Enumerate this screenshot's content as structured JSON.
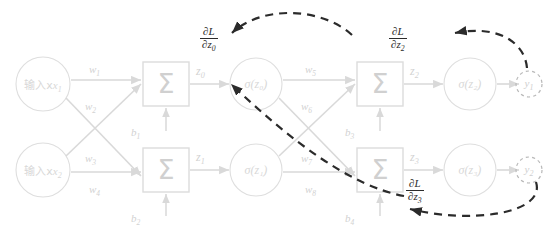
{
  "diagram": {
    "colors": {
      "forward": "#d9d9d9",
      "forward_text": "#d2d2d2",
      "gradient": "#2b2b2b",
      "background": "#ffffff"
    },
    "inputs": [
      {
        "id": "x1",
        "label": "输入x",
        "sub": "1"
      },
      {
        "id": "x2",
        "label": "输入x",
        "sub": "2"
      }
    ],
    "sum_symbol": "Σ",
    "hidden_sums": [
      {
        "id": "sum1",
        "symbol": "Σ"
      },
      {
        "id": "sum2",
        "symbol": "Σ"
      }
    ],
    "output_sums": [
      {
        "id": "sum3",
        "symbol": "Σ"
      },
      {
        "id": "sum4",
        "symbol": "Σ"
      }
    ],
    "weights_input": [
      {
        "id": "w1",
        "label": "w",
        "sub": "1"
      },
      {
        "id": "w2",
        "label": "w",
        "sub": "2"
      },
      {
        "id": "w3",
        "label": "w",
        "sub": "3"
      },
      {
        "id": "w4",
        "label": "w",
        "sub": "4"
      }
    ],
    "weights_hidden": [
      {
        "id": "w5",
        "label": "w",
        "sub": "5"
      },
      {
        "id": "w6",
        "label": "w",
        "sub": "6"
      },
      {
        "id": "w7",
        "label": "w",
        "sub": "7"
      },
      {
        "id": "w8",
        "label": "w",
        "sub": "8"
      }
    ],
    "biases": [
      {
        "id": "b1",
        "label": "b",
        "sub": "1"
      },
      {
        "id": "b2",
        "label": "b",
        "sub": "2"
      },
      {
        "id": "b3",
        "label": "b",
        "sub": "3"
      },
      {
        "id": "b4",
        "label": "b",
        "sub": "4"
      }
    ],
    "pre_activations": [
      {
        "id": "z0",
        "label": "z",
        "sub": "0"
      },
      {
        "id": "z1",
        "label": "z",
        "sub": "1"
      },
      {
        "id": "z2",
        "label": "z",
        "sub": "2"
      },
      {
        "id": "z3",
        "label": "z",
        "sub": "3"
      }
    ],
    "activations": [
      {
        "id": "sz0",
        "label": "σ(z₀)"
      },
      {
        "id": "sz1",
        "label": "σ(z₁)"
      },
      {
        "id": "sz2",
        "label": "σ(z₂)"
      },
      {
        "id": "sz3",
        "label": "σ(z₃)"
      }
    ],
    "outputs": [
      {
        "id": "y1",
        "label": "y",
        "sub": "1"
      },
      {
        "id": "y2",
        "label": "y",
        "sub": "2"
      }
    ],
    "gradients": [
      {
        "id": "dLdz0",
        "numerator": "∂L",
        "denominator": "∂z",
        "den_sub": "0"
      },
      {
        "id": "dLdz2",
        "numerator": "∂L",
        "denominator": "∂z",
        "den_sub": "2"
      },
      {
        "id": "dLdz3",
        "numerator": "∂L",
        "denominator": "∂z",
        "den_sub": "3"
      }
    ]
  }
}
